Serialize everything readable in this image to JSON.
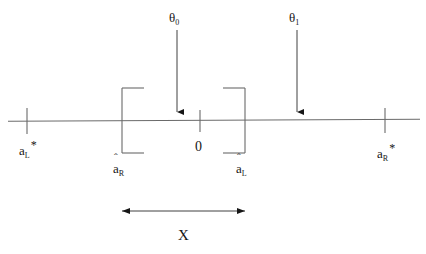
{
  "figure": {
    "type": "number-line-interval-diagram",
    "width": 426,
    "height": 254,
    "background_color": "#ffffff",
    "line_color": "#555555",
    "text_color": "#161616"
  },
  "axis": {
    "name": "real-line",
    "y": 120,
    "x_start": 8,
    "x_end": 420,
    "origin_label": "0",
    "origin_x": 200
  },
  "ticks": [
    {
      "id": "tick-a-star-L",
      "x": 27,
      "label_base": "a",
      "label_sub": "L",
      "label_sup": "*",
      "label_text": "a*L"
    },
    {
      "id": "tick-origin",
      "x": 200,
      "label_base": "0",
      "label_sub": "",
      "label_sup": "",
      "label_text": "0"
    },
    {
      "id": "tick-a-star-R",
      "x": 385,
      "label_base": "a",
      "label_sub": "R",
      "label_sup": "*",
      "label_text": "a*R"
    }
  ],
  "brackets": [
    {
      "id": "bracket-left",
      "orientation": "open",
      "x": 122,
      "label_base": "a",
      "label_hat": "ˆ",
      "label_sub": "R",
      "label_text": "âR"
    },
    {
      "id": "bracket-right",
      "orientation": "close",
      "x": 245,
      "label_base": "a",
      "label_hat": "ˆ",
      "label_sub": "L",
      "label_text": "âL"
    }
  ],
  "arrows": [
    {
      "id": "theta-0-arrow",
      "x": 177,
      "y_top": 30,
      "y_bottom": 116,
      "label_base": "θ",
      "label_sub": "0",
      "label_text": "θ0"
    },
    {
      "id": "theta-1-arrow",
      "x": 297,
      "y_top": 30,
      "y_bottom": 116,
      "label_base": "θ",
      "label_sub": "1",
      "label_text": "θ1"
    }
  ],
  "span": {
    "id": "x-span",
    "label": "X",
    "y": 211,
    "x_start": 122,
    "x_end": 245,
    "double_headed": true
  }
}
